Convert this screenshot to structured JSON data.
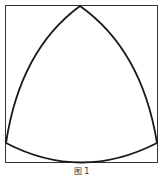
{
  "figure": {
    "caption": "图 1",
    "shape": "Reuleaux triangle inscribed in square",
    "colors": {
      "stroke": "#1a1a1a",
      "square_stroke": "#333333",
      "background": "#ffffff"
    },
    "square": {
      "x": 5,
      "y": 5,
      "width": 153,
      "height": 158
    },
    "vertices": {
      "top": [
        80,
        6
      ],
      "bottom_left": [
        6,
        143
      ],
      "bottom_right": [
        157,
        143
      ]
    },
    "bottom_arc_lowest_y": 162
  }
}
